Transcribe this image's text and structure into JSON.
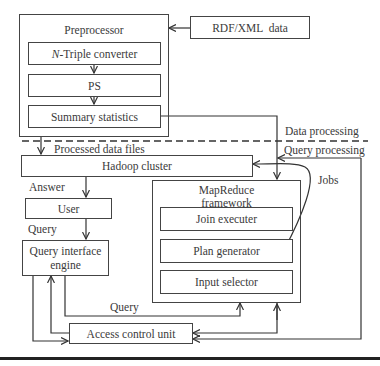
{
  "diagram": {
    "preprocessor": {
      "title": "Preprocessor",
      "steps": [
        {
          "prefix": "N",
          "label": "-Triple converter"
        },
        {
          "label": "PS"
        },
        {
          "label": "Summary statistics"
        }
      ]
    },
    "rdf_xml": "RDF/XML  data",
    "hadoop": "Hadoop cluster",
    "mapreduce": {
      "title_line1": "MapReduce",
      "title_line2": "framework",
      "components": [
        "Join executer",
        "Plan generator",
        "Input selector"
      ]
    },
    "user": "User",
    "query_interface_line1": "Query interface",
    "query_interface_line2": "engine",
    "access_control": "Access control unit",
    "labels": {
      "processed_data_files": "Processed data files",
      "data_processing": "Data processing",
      "query_processing": "Query processing",
      "answer": "Answer",
      "query_user": "Query",
      "query_bottom": "Query",
      "jobs": "Jobs"
    }
  }
}
